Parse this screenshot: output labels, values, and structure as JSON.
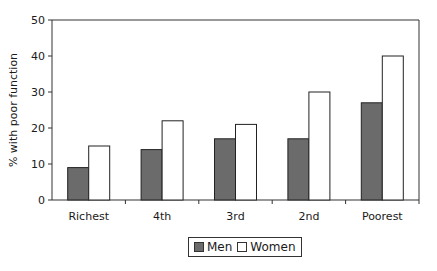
{
  "chart_data": {
    "type": "bar",
    "title": "",
    "xlabel": "",
    "ylabel": "% with poor function",
    "categories": [
      "Richest",
      "4th",
      "3rd",
      "2nd",
      "Poorest"
    ],
    "series": [
      {
        "name": "Men",
        "values": [
          9,
          14,
          17,
          17,
          27
        ],
        "color": "#6b6b6b"
      },
      {
        "name": "Women",
        "values": [
          15,
          22,
          21,
          30,
          40
        ],
        "color": "#ffffff"
      }
    ],
    "ylim": [
      0,
      50
    ],
    "yticks": [
      0,
      10,
      20,
      30,
      40,
      50
    ],
    "grid": false,
    "legend_position": "bottom"
  },
  "legend": {
    "men_label": "Men",
    "women_label": "Women"
  }
}
